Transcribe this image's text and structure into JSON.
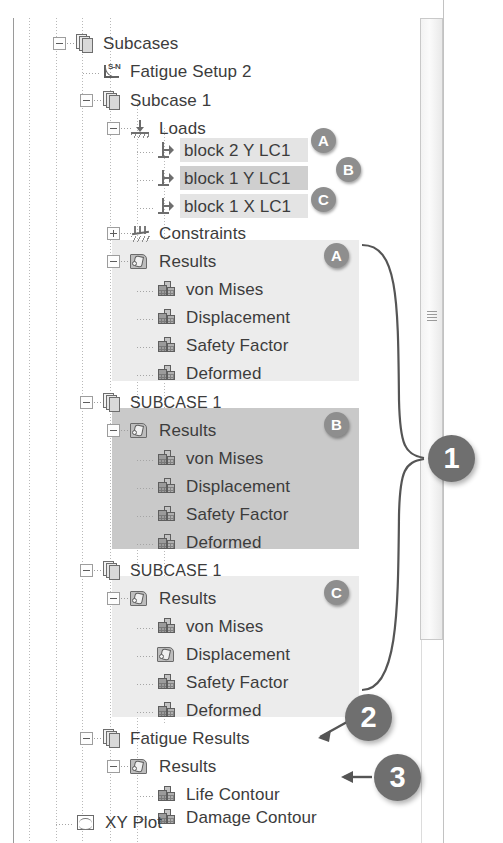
{
  "panel": {
    "title": "Model tree",
    "rows": [
      {
        "id": "subcases",
        "label": "Subcases",
        "icon": "pages-icon",
        "depth": 1,
        "expander": "minus",
        "top": 29,
        "highlight": "none"
      },
      {
        "id": "fatigue-setup-2",
        "label": "Fatigue Setup 2",
        "icon": "sn-curve-icon",
        "depth": 2,
        "expander": "none",
        "top": 57,
        "highlight": "none"
      },
      {
        "id": "subcase-1",
        "label": "Subcase 1",
        "icon": "pages-icon",
        "depth": 2,
        "expander": "minus",
        "top": 86,
        "highlight": "none"
      },
      {
        "id": "loads",
        "label": "Loads",
        "icon": "load-icon",
        "depth": 3,
        "expander": "minus",
        "top": 114,
        "highlight": "none"
      },
      {
        "id": "block-2-y-lc1",
        "label": "block 2 Y LC1",
        "icon": "force-arrow-icon",
        "depth": 4,
        "expander": "none",
        "top": 136,
        "highlight": "row"
      },
      {
        "id": "block-1-y-lc1",
        "label": "block 1 Y LC1",
        "icon": "force-arrow-icon",
        "depth": 4,
        "expander": "none",
        "top": 164,
        "highlight": "rowdark"
      },
      {
        "id": "block-1-x-lc1",
        "label": "block 1 X LC1",
        "icon": "force-arrow-icon",
        "depth": 4,
        "expander": "none",
        "top": 192,
        "highlight": "row"
      },
      {
        "id": "constraints",
        "label": "Constraints",
        "icon": "constraints-icon",
        "depth": 3,
        "expander": "plus",
        "top": 219,
        "highlight": "none"
      },
      {
        "id": "results-a",
        "label": "Results",
        "icon": "results-hand-icon",
        "depth": 3,
        "expander": "minus",
        "top": 247,
        "highlight": "none"
      },
      {
        "id": "von-mises-a",
        "label": "von Mises",
        "icon": "contour-block-icon",
        "depth": 4,
        "expander": "none",
        "top": 275,
        "highlight": "none"
      },
      {
        "id": "displacement-a",
        "label": "Displacement",
        "icon": "contour-block-icon",
        "depth": 4,
        "expander": "none",
        "top": 303,
        "highlight": "none"
      },
      {
        "id": "safety-factor-a",
        "label": "Safety Factor",
        "icon": "contour-block-icon",
        "depth": 4,
        "expander": "none",
        "top": 331,
        "highlight": "none"
      },
      {
        "id": "deformed-a",
        "label": "Deformed",
        "icon": "contour-block-icon",
        "depth": 4,
        "expander": "none",
        "top": 359,
        "highlight": "none"
      },
      {
        "id": "subcase-1-caps-b",
        "label": "SUBCASE 1",
        "icon": "pages-icon",
        "depth": 2,
        "expander": "minus",
        "top": 388,
        "highlight": "none",
        "caps": true
      },
      {
        "id": "results-b",
        "label": "Results",
        "icon": "results-hand-icon",
        "depth": 3,
        "expander": "minus",
        "top": 416,
        "highlight": "none"
      },
      {
        "id": "von-mises-b",
        "label": "von Mises",
        "icon": "contour-block-icon",
        "depth": 4,
        "expander": "none",
        "top": 444,
        "highlight": "none"
      },
      {
        "id": "displacement-b",
        "label": "Displacement",
        "icon": "contour-block-icon",
        "depth": 4,
        "expander": "none",
        "top": 472,
        "highlight": "none"
      },
      {
        "id": "safety-factor-b",
        "label": "Safety Factor",
        "icon": "contour-block-icon",
        "depth": 4,
        "expander": "none",
        "top": 500,
        "highlight": "none"
      },
      {
        "id": "deformed-b",
        "label": "Deformed",
        "icon": "contour-block-icon",
        "depth": 4,
        "expander": "none",
        "top": 528,
        "highlight": "none"
      },
      {
        "id": "subcase-1-caps-c",
        "label": "SUBCASE 1",
        "icon": "pages-icon",
        "depth": 2,
        "expander": "minus",
        "top": 556,
        "highlight": "none",
        "caps": true
      },
      {
        "id": "results-c",
        "label": "Results",
        "icon": "results-hand-icon",
        "depth": 3,
        "expander": "minus",
        "top": 584,
        "highlight": "none"
      },
      {
        "id": "von-mises-c",
        "label": "von Mises",
        "icon": "contour-block-icon",
        "depth": 4,
        "expander": "none",
        "top": 612,
        "highlight": "none"
      },
      {
        "id": "displacement-c",
        "label": "Displacement",
        "icon": "results-hand-icon",
        "depth": 4,
        "expander": "none",
        "top": 640,
        "highlight": "none"
      },
      {
        "id": "safety-factor-c",
        "label": "Safety Factor",
        "icon": "contour-block-icon",
        "depth": 4,
        "expander": "none",
        "top": 668,
        "highlight": "none"
      },
      {
        "id": "deformed-c",
        "label": "Deformed",
        "icon": "contour-block-icon",
        "depth": 4,
        "expander": "none",
        "top": 696,
        "highlight": "none"
      },
      {
        "id": "fatigue-results",
        "label": "Fatigue Results",
        "icon": "pages-icon",
        "depth": 2,
        "expander": "minus",
        "top": 724,
        "highlight": "none"
      },
      {
        "id": "results-fatigue",
        "label": "Results",
        "icon": "results-hand-icon",
        "depth": 3,
        "expander": "minus",
        "top": 752,
        "highlight": "none"
      },
      {
        "id": "life-contour",
        "label": "Life Contour",
        "icon": "contour-block-icon",
        "depth": 4,
        "expander": "none",
        "top": 780,
        "highlight": "none"
      },
      {
        "id": "damage-contour",
        "label": "Damage Contour",
        "icon": "contour-block-icon",
        "depth": 4,
        "expander": "none",
        "top": 803,
        "highlight": "none"
      },
      {
        "id": "xy-plot",
        "label": "XY Plot",
        "icon": "xy-plot-icon",
        "depth": 1,
        "expander": "none",
        "top": 808,
        "highlight": "none"
      }
    ]
  },
  "group_highlights": [
    {
      "id": "group-a",
      "label": "A",
      "tone": "light",
      "x": 112,
      "y": 240,
      "w": 247,
      "h": 141
    },
    {
      "id": "group-b",
      "label": "B",
      "tone": "dark",
      "x": 112,
      "y": 408,
      "w": 247,
      "h": 141
    },
    {
      "id": "group-c",
      "label": "C",
      "tone": "light",
      "x": 112,
      "y": 576,
      "w": 247,
      "h": 141
    }
  ],
  "badges": {
    "letters": [
      {
        "id": "badge-a-load",
        "text": "A",
        "x": 311,
        "y": 128
      },
      {
        "id": "badge-b-load",
        "text": "B",
        "x": 336,
        "y": 157
      },
      {
        "id": "badge-c-load",
        "text": "C",
        "x": 311,
        "y": 187
      },
      {
        "id": "badge-a-results",
        "text": "A",
        "x": 324,
        "y": 243
      },
      {
        "id": "badge-b-results",
        "text": "B",
        "x": 324,
        "y": 412
      },
      {
        "id": "badge-c-results",
        "text": "C",
        "x": 324,
        "y": 580
      }
    ],
    "numbers": [
      {
        "id": "callout-1",
        "text": "1",
        "x": 428,
        "y": 435
      },
      {
        "id": "callout-2",
        "text": "2",
        "x": 345,
        "y": 694
      },
      {
        "id": "callout-3",
        "text": "3",
        "x": 374,
        "y": 754
      }
    ]
  },
  "colors": {
    "background": "#ffffff",
    "text": "#3c3c3c",
    "highlight_light": "#ececec",
    "highlight_dark": "#c9c9c9",
    "badge_letter": "#8e8e8e",
    "badge_number": "#6f6f6f",
    "tree_line": "#b9b9b9",
    "scrollbar_track": "#f3f3f3"
  },
  "scrollbar": {
    "name": "vertical-scrollbar",
    "thumb_label": "scroll-thumb"
  }
}
